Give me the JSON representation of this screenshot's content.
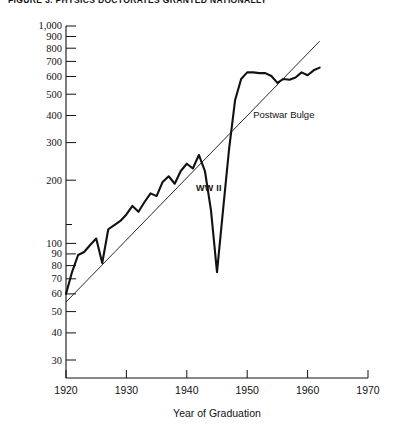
{
  "figure": {
    "title": "FIGURE 3.  PHYSICS DOCTORATES GRANTED NATIONALLY"
  },
  "chart_data": {
    "type": "line",
    "title": "FIGURE 3.  PHYSICS DOCTORATES GRANTED NATIONALLY",
    "xlabel": "Year of Graduation",
    "ylabel": "",
    "xlim": [
      1920,
      1970
    ],
    "ylim": [
      10,
      1000
    ],
    "yscale": "log",
    "xscale": "linear",
    "grid": false,
    "legend": false,
    "xticks": [
      1920,
      1930,
      1940,
      1950,
      1960,
      1970
    ],
    "xtick_labels": [
      "1920",
      "1930",
      "1940",
      "1950",
      "1960",
      "1970"
    ],
    "yticks": [
      10,
      20,
      30,
      40,
      50,
      60,
      70,
      80,
      90,
      100,
      200,
      300,
      400,
      500,
      600,
      700,
      800,
      900,
      1000
    ],
    "ytick_labels": [
      "10",
      "20",
      "30",
      "40",
      "50",
      "60",
      "70",
      "80",
      "90",
      "100",
      "200",
      "300",
      "400",
      "500",
      "600",
      "700",
      "800",
      "900",
      "1,000"
    ],
    "ytick_labeled": [
      10,
      20,
      30,
      40,
      50,
      60,
      70,
      80,
      90,
      100,
      200,
      300,
      400,
      500,
      600,
      700,
      800,
      900,
      1000
    ],
    "annotations": [
      {
        "text": "WW II",
        "x": 1941.5,
        "y": 115
      },
      {
        "text": "Postwar Bulge",
        "x": 1951.0,
        "y": 300
      }
    ],
    "series": [
      {
        "name": "Physics doctorates granted",
        "style": "solid-thick",
        "x": [
          1920,
          1921,
          1922,
          1923,
          1924,
          1925,
          1926,
          1927,
          1928,
          1929,
          1930,
          1931,
          1932,
          1933,
          1934,
          1935,
          1936,
          1937,
          1938,
          1939,
          1940,
          1941,
          1942,
          1943,
          1944,
          1945,
          1946,
          1947,
          1948,
          1949,
          1950,
          1951,
          1952,
          1953,
          1954,
          1955,
          1956,
          1957,
          1958,
          1959,
          1960,
          1961,
          1962
        ],
        "values": [
          30,
          40,
          50,
          52,
          57,
          62,
          45,
          70,
          74,
          78,
          85,
          95,
          88,
          100,
          112,
          108,
          130,
          140,
          127,
          150,
          165,
          155,
          185,
          150,
          90,
          40,
          90,
          200,
          380,
          500,
          545,
          545,
          540,
          540,
          520,
          475,
          500,
          495,
          510,
          545,
          525,
          560,
          580
        ]
      },
      {
        "name": "Exponential trend line",
        "style": "solid-thin",
        "x": [
          1920,
          1962
        ],
        "values": [
          27,
          820
        ]
      }
    ]
  }
}
